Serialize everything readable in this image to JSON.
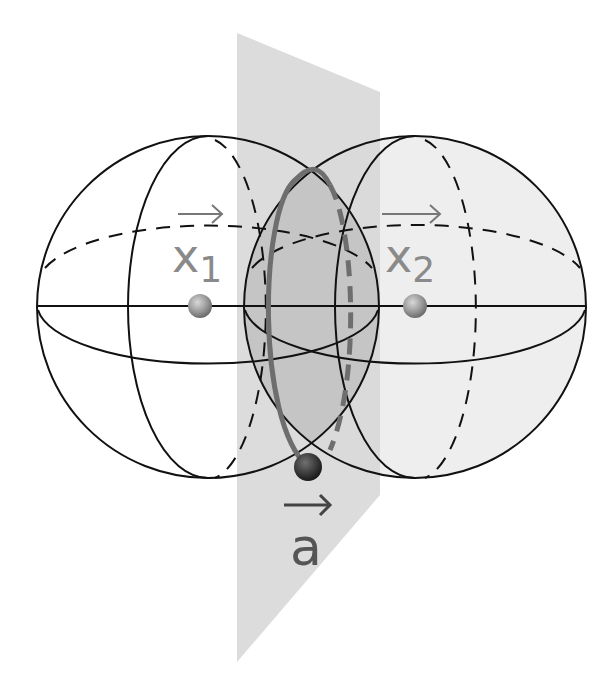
{
  "figure": {
    "labels": {
      "center_1": "x",
      "center_1_sub": "1",
      "center_2": "x",
      "center_2_sub": "2",
      "point": "a",
      "point_arrow": "→"
    },
    "colors": {
      "outline": "#111111",
      "plane": "#d9d9d9",
      "lens": "#c4c4c4",
      "sphere_fill_right": "#eeeeee",
      "intersection_circle": "#6e6e6e",
      "label": "#8a8a8a",
      "center_ball": "#9a9a9a",
      "point_ball": "#3a3a3a"
    },
    "elements": [
      "sphere-1",
      "sphere-2",
      "bisecting-plane",
      "intersection-circle",
      "center-x1",
      "center-x2",
      "point-a"
    ]
  }
}
